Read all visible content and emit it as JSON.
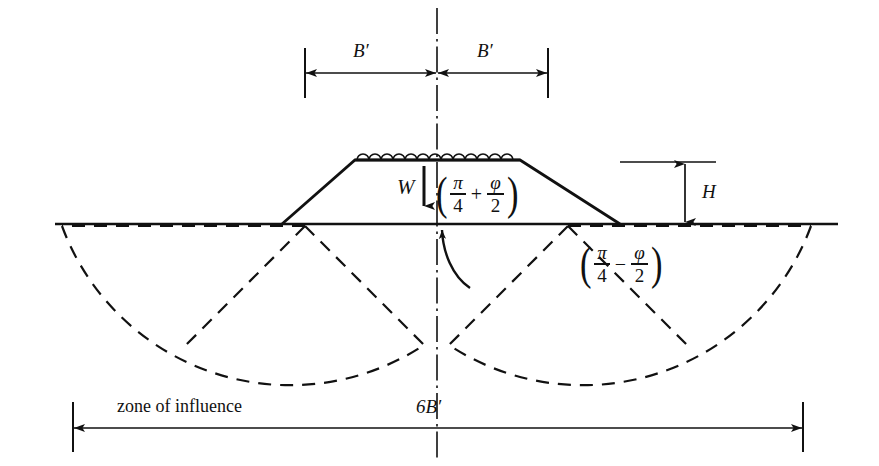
{
  "figure": {
    "ink_color": "#111111",
    "background": "#ffffff"
  },
  "dimensions": {
    "half_width_left": "B′",
    "half_width_right": "B′",
    "height": "H",
    "total_width": "6B′"
  },
  "labels": {
    "load_weight": "W",
    "zone_of_influence": "zone of influence"
  },
  "formulas": {
    "active_wedge": {
      "open_paren": "(",
      "first_num": "π",
      "first_den": "4",
      "operator": "+",
      "second_num": "φ",
      "second_den": "2",
      "close_paren": ")",
      "plain": "(π/4 + φ/2)"
    },
    "passive_wedge": {
      "open_paren": "(",
      "first_num": "π",
      "first_den": "4",
      "operator": "−",
      "second_num": "φ",
      "second_den": "2",
      "close_paren": ")",
      "plain": "(π/4 − φ/2)"
    }
  },
  "geometry": {
    "ground_line_y": 224,
    "centerline_x": 437,
    "embankment_top_y": 160,
    "embankment_top_left_x": 355,
    "embankment_top_right_x": 520,
    "embankment_toe_left_x": 282,
    "embankment_toe_right_x": 620,
    "wedge_apex_left_x": 305,
    "wedge_apex_right_x": 568,
    "bottom_dim_y": 428,
    "bottom_dim_left_x": 73,
    "bottom_dim_right_x": 803,
    "top_dim_y": 73,
    "top_dim_left_x": 305,
    "top_dim_right_x": 548,
    "h_dim_x": 685
  }
}
